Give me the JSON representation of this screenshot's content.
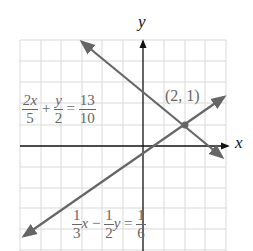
{
  "axes": {
    "x_label": "x",
    "y_label": "y"
  },
  "grid": {
    "x_min": -6,
    "x_max": 4,
    "y_min": -5,
    "y_max": 5
  },
  "point": {
    "label": "(2, 1)",
    "x": 2,
    "y": 1
  },
  "equation1": {
    "a_num": "2x",
    "a_den": "5",
    "plus": "+",
    "b_num": "y",
    "b_den": "2",
    "eq": "=",
    "c_num": "13",
    "c_den": "10"
  },
  "equation2": {
    "a_num": "1",
    "a_den": "3",
    "x": "x",
    "minus": "−",
    "b_num": "1",
    "b_den": "2",
    "y": "y",
    "eq": "=",
    "c_num": "1",
    "c_den": "6"
  },
  "colors": {
    "line": "#666666",
    "grid": "#d9d9d9",
    "axis": "#111111"
  }
}
